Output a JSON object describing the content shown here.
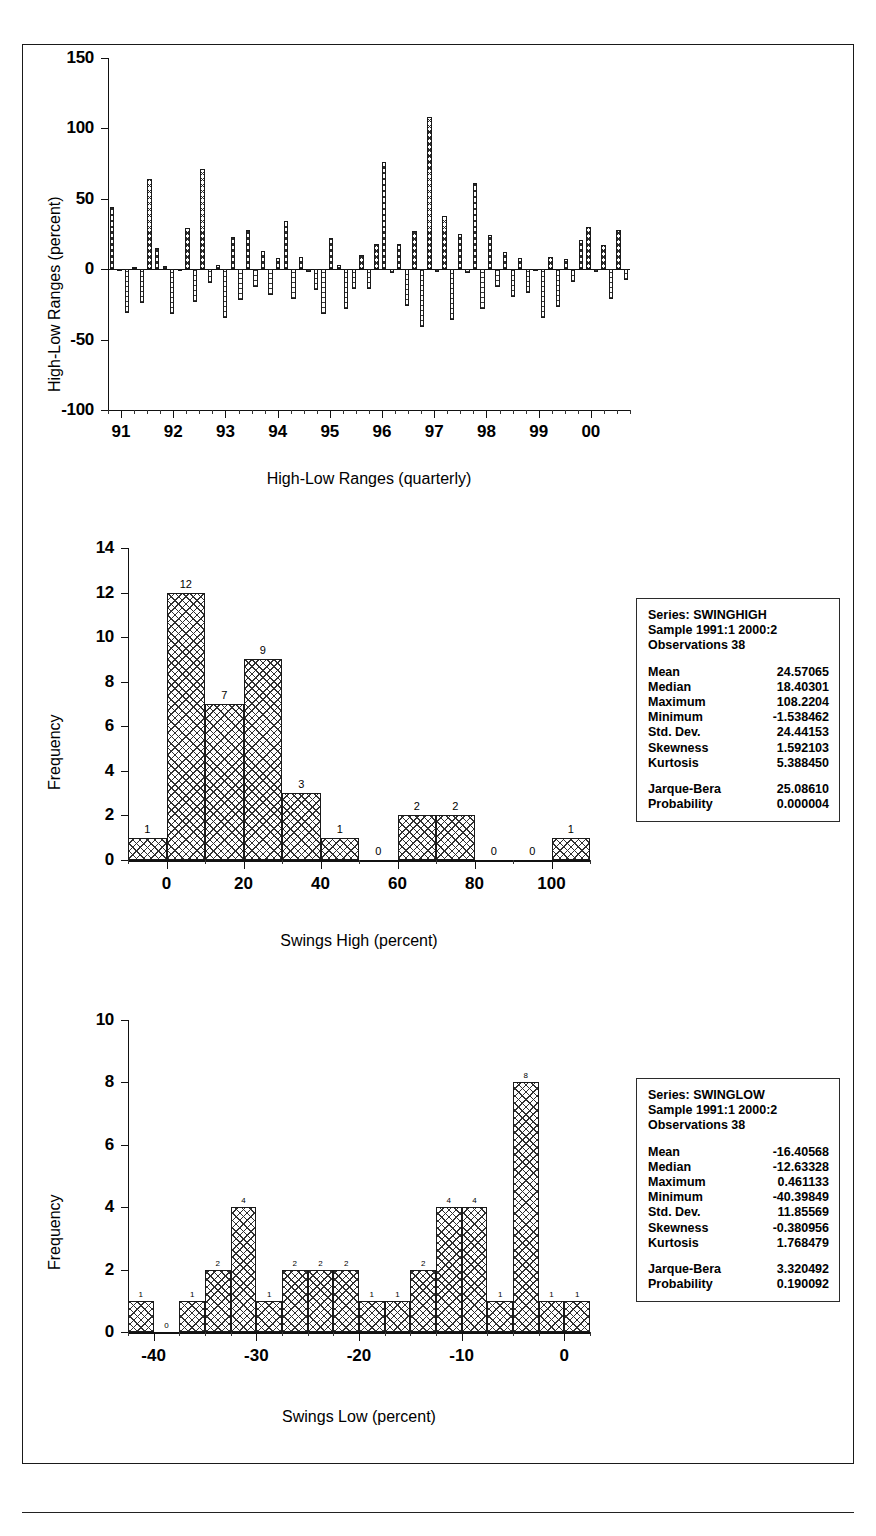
{
  "document": {
    "title": "Natural Gas Futures — High-Low Ranges and Swing Distributions"
  },
  "chart_data": [
    {
      "id": "highlow",
      "type": "bar",
      "title": "Natural Gas Futures",
      "xlabel": "High-Low Ranges (quarterly)",
      "ylabel": "High-Low Ranges (percent)",
      "ylim": [
        -100,
        150
      ],
      "yticks": [
        -100,
        -50,
        0,
        50,
        100,
        150
      ],
      "xticks": [
        "91",
        "92",
        "93",
        "94",
        "95",
        "96",
        "97",
        "98",
        "99",
        "00"
      ],
      "grid": false,
      "legend": "none",
      "series": [
        {
          "name": "Swing High",
          "values": [
            44,
            -1.5,
            -31,
            1.5,
            -24,
            64,
            15,
            2,
            -32,
            -1,
            29,
            -23,
            71,
            -10,
            3,
            -35,
            23,
            -22,
            28,
            -13,
            13,
            -18,
            8,
            34,
            -21,
            9,
            -2,
            -15,
            -32,
            22,
            3,
            -28,
            -14,
            10,
            -14,
            18,
            76,
            -3,
            18,
            -26,
            27,
            -41,
            108,
            -2,
            38,
            -36,
            25,
            -3,
            61,
            -28,
            24,
            -13,
            12,
            -20,
            8,
            -17,
            -1,
            -35,
            9,
            -27,
            7,
            -9,
            21,
            30,
            -2,
            17,
            -21,
            28,
            -8
          ]
        }
      ],
      "bars": [
        {
          "v": 44
        },
        {
          "v": -1.5
        },
        {
          "v": -31
        },
        {
          "v": 1.5
        },
        {
          "v": -24
        },
        {
          "v": 64
        },
        {
          "v": 15
        },
        {
          "v": 2
        },
        {
          "v": -32
        },
        {
          "v": -1
        },
        {
          "v": 29
        },
        {
          "v": -23
        },
        {
          "v": 71
        },
        {
          "v": -10
        },
        {
          "v": 3
        },
        {
          "v": -35
        },
        {
          "v": 23
        },
        {
          "v": -22
        },
        {
          "v": 28
        },
        {
          "v": -13
        },
        {
          "v": 13
        },
        {
          "v": -18
        },
        {
          "v": 8
        },
        {
          "v": 34
        },
        {
          "v": -21
        },
        {
          "v": 9
        },
        {
          "v": -2
        },
        {
          "v": -15
        },
        {
          "v": -32
        },
        {
          "v": 22
        },
        {
          "v": 3
        },
        {
          "v": -28
        },
        {
          "v": -14
        },
        {
          "v": 10
        },
        {
          "v": -14
        },
        {
          "v": 18
        },
        {
          "v": 76
        },
        {
          "v": -3
        },
        {
          "v": 18
        },
        {
          "v": -26
        },
        {
          "v": 27
        },
        {
          "v": -41
        },
        {
          "v": 108
        },
        {
          "v": -2
        },
        {
          "v": 38
        },
        {
          "v": -36
        },
        {
          "v": 25
        },
        {
          "v": -3
        },
        {
          "v": 61
        },
        {
          "v": -28
        },
        {
          "v": 24
        },
        {
          "v": -13
        },
        {
          "v": 12
        },
        {
          "v": -20
        },
        {
          "v": 8
        },
        {
          "v": -17
        },
        {
          "v": -1
        },
        {
          "v": -35
        },
        {
          "v": 9
        },
        {
          "v": -27
        },
        {
          "v": 7
        },
        {
          "v": -9
        },
        {
          "v": 21
        },
        {
          "v": 30
        },
        {
          "v": -2
        },
        {
          "v": 17
        },
        {
          "v": -21
        },
        {
          "v": 28
        },
        {
          "v": -8
        }
      ]
    },
    {
      "id": "swinghigh",
      "type": "bar",
      "title": "Natural Gas Futures",
      "xlabel": "Swings High (percent)",
      "ylabel": "Frequency",
      "ylim": [
        0,
        14
      ],
      "yticks": [
        0,
        2,
        4,
        6,
        8,
        10,
        12,
        14
      ],
      "xticks": [
        0,
        20,
        40,
        60,
        80,
        100
      ],
      "xlim": [
        -10,
        110
      ],
      "grid": false,
      "legend": "none",
      "bin_edges": [
        -10,
        0,
        10,
        20,
        30,
        40,
        50,
        60,
        70,
        80,
        90,
        100,
        110
      ],
      "bin_labels": [
        "1",
        "12",
        "7",
        "9",
        "3",
        "1",
        "0",
        "2",
        "2",
        "0",
        "0",
        "1"
      ],
      "values": [
        1,
        12,
        7,
        9,
        3,
        1,
        0,
        2,
        2,
        0,
        0,
        1
      ]
    },
    {
      "id": "swinglow",
      "type": "bar",
      "title": "Natural Gas Futures",
      "xlabel": "Swings Low (percent)",
      "ylabel": "Frequency",
      "ylim": [
        0,
        10
      ],
      "yticks": [
        0,
        2,
        4,
        6,
        8,
        10
      ],
      "xticks": [
        -40,
        -30,
        -20,
        -10,
        0
      ],
      "xlim": [
        -42.5,
        2.5
      ],
      "grid": false,
      "legend": "none",
      "bin_edges": [
        -42.5,
        -40,
        -37.5,
        -35,
        -32.5,
        -30,
        -27.5,
        -25,
        -22.5,
        -20,
        -17.5,
        -15,
        -12.5,
        -10,
        -7.5,
        -5,
        -2.5,
        0,
        2.5
      ],
      "bin_labels": [
        "1",
        "0",
        "1",
        "2",
        "4",
        "1",
        "2",
        "2",
        "2",
        "1",
        "1",
        "2",
        "4",
        "4",
        "1",
        "8",
        "1",
        "1"
      ],
      "values": [
        1,
        0,
        1,
        2,
        4,
        1,
        2,
        2,
        2,
        1,
        1,
        2,
        4,
        4,
        1,
        8,
        1,
        1
      ]
    }
  ],
  "stats_boxes": [
    {
      "id": "swinghigh-stats",
      "series_label": "Series: SWINGHIGH",
      "sample_label": "Sample 1991:1 2000:2",
      "observations_label": "Observations 38",
      "rows": [
        {
          "key": "Mean",
          "value": "24.57065"
        },
        {
          "key": "Median",
          "value": "18.40301"
        },
        {
          "key": "Maximum",
          "value": "108.2204"
        },
        {
          "key": "Minimum",
          "value": "-1.538462"
        },
        {
          "key": "Std. Dev.",
          "value": "24.44153"
        },
        {
          "key": "Skewness",
          "value": "1.592103"
        },
        {
          "key": "Kurtosis",
          "value": "5.388450"
        }
      ],
      "test_rows": [
        {
          "key": "Jarque-Bera",
          "value": "25.08610"
        },
        {
          "key": "Probability",
          "value": "0.000004"
        }
      ]
    },
    {
      "id": "swinglow-stats",
      "series_label": "Series: SWINGLOW",
      "sample_label": "Sample 1991:1 2000:2",
      "observations_label": "Observations 38",
      "rows": [
        {
          "key": "Mean",
          "value": "-16.40568"
        },
        {
          "key": "Median",
          "value": "-12.63328"
        },
        {
          "key": "Maximum",
          "value": "0.461133"
        },
        {
          "key": "Minimum",
          "value": "-40.39849"
        },
        {
          "key": "Std. Dev.",
          "value": "11.85569"
        },
        {
          "key": "Skewness",
          "value": "-0.380956"
        },
        {
          "key": "Kurtosis",
          "value": "1.768479"
        }
      ],
      "test_rows": [
        {
          "key": "Jarque-Bera",
          "value": "3.320492"
        },
        {
          "key": "Probability",
          "value": "0.190092"
        }
      ]
    }
  ],
  "colors": {
    "ink": "#111111",
    "border": "#1a1a1a",
    "paper": "#ffffff"
  }
}
